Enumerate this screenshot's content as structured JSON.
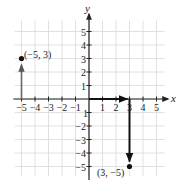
{
  "chart_data": {
    "type": "scatter",
    "title": "",
    "xlabel": "x",
    "ylabel": "y",
    "xlim": [
      -5.5,
      6
    ],
    "ylim": [
      -6,
      6
    ],
    "grid": true,
    "x_ticks": [
      "-5",
      "-4",
      "-3",
      "-2",
      "-1",
      "1",
      "2",
      "3",
      "4",
      "5"
    ],
    "y_ticks": [
      "5",
      "4",
      "3",
      "2",
      "1",
      "-1",
      "-2",
      "-3",
      "-4",
      "-5"
    ],
    "points": [
      {
        "x": -5,
        "y": 3,
        "label": "(−5, 3)"
      },
      {
        "x": 3,
        "y": -5,
        "label": "(3, −5)"
      }
    ],
    "annotations": [
      "Arrow from (-5,0) up to (-5,3)",
      "Arrow from (0,0) right to (3,0)",
      "Arrow from (3,0) down to (3,-5)"
    ]
  },
  "axes": {
    "x_label": "x",
    "y_label": "y"
  },
  "labels": {
    "point_a": "(−5, 3)",
    "point_b": "(3, −5)"
  },
  "colors": {
    "grid": "#d8d8d8",
    "axis": "#222222",
    "point": "#111111"
  }
}
